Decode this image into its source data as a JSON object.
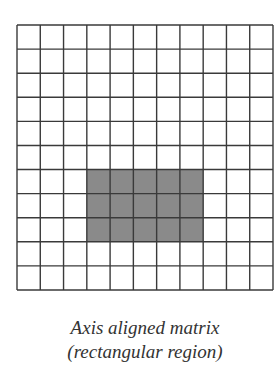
{
  "figure": {
    "caption_line1": "Axis aligned matrix",
    "caption_line2": "(rectangular region)"
  },
  "grid": {
    "rows": 11,
    "cols": 11,
    "origin_x": 17,
    "origin_y": 25,
    "width": 256,
    "height": 265,
    "line_color": "#3a3a3a",
    "background_color": "#ffffff",
    "highlight": {
      "row_start": 6,
      "row_end": 8,
      "col_start": 3,
      "col_end": 7,
      "fill_color": "#8a8a8a"
    }
  },
  "chart_data": {
    "type": "heatmap",
    "title": "Axis aligned matrix (rectangular region)",
    "rows": 11,
    "cols": 11,
    "highlighted_region": {
      "rows": [
        6,
        7,
        8
      ],
      "cols": [
        3,
        4,
        5,
        6,
        7
      ]
    },
    "values": [
      [
        0,
        0,
        0,
        0,
        0,
        0,
        0,
        0,
        0,
        0,
        0
      ],
      [
        0,
        0,
        0,
        0,
        0,
        0,
        0,
        0,
        0,
        0,
        0
      ],
      [
        0,
        0,
        0,
        0,
        0,
        0,
        0,
        0,
        0,
        0,
        0
      ],
      [
        0,
        0,
        0,
        0,
        0,
        0,
        0,
        0,
        0,
        0,
        0
      ],
      [
        0,
        0,
        0,
        0,
        0,
        0,
        0,
        0,
        0,
        0,
        0
      ],
      [
        0,
        0,
        0,
        0,
        0,
        0,
        0,
        0,
        0,
        0,
        0
      ],
      [
        0,
        0,
        0,
        1,
        1,
        1,
        1,
        1,
        0,
        0,
        0
      ],
      [
        0,
        0,
        0,
        1,
        1,
        1,
        1,
        1,
        0,
        0,
        0
      ],
      [
        0,
        0,
        0,
        1,
        1,
        1,
        1,
        1,
        0,
        0,
        0
      ],
      [
        0,
        0,
        0,
        0,
        0,
        0,
        0,
        0,
        0,
        0,
        0
      ],
      [
        0,
        0,
        0,
        0,
        0,
        0,
        0,
        0,
        0,
        0,
        0
      ]
    ]
  }
}
